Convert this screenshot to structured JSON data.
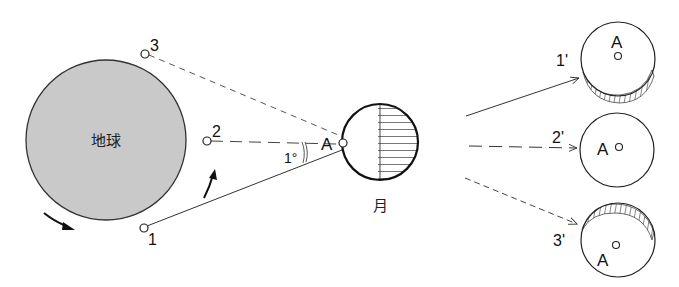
{
  "diagram": {
    "earth": {
      "label": "地球",
      "fill": "#c9c9c9",
      "points": [
        {
          "id": "1",
          "label": "1"
        },
        {
          "id": "2",
          "label": "2"
        },
        {
          "id": "3",
          "label": "3"
        }
      ]
    },
    "moon": {
      "label": "月",
      "point_label": "A",
      "angle_label": "1°"
    },
    "views": [
      {
        "id": "1p",
        "label": "1'",
        "point_label": "A",
        "line_style": "solid"
      },
      {
        "id": "2p",
        "label": "2'",
        "point_label": "A",
        "line_style": "long-dash"
      },
      {
        "id": "3p",
        "label": "3'",
        "point_label": "A",
        "line_style": "short-dash"
      }
    ],
    "colors": {
      "stroke": "#111111",
      "earth_fill": "#c9c9c9",
      "line": "#333333"
    }
  }
}
